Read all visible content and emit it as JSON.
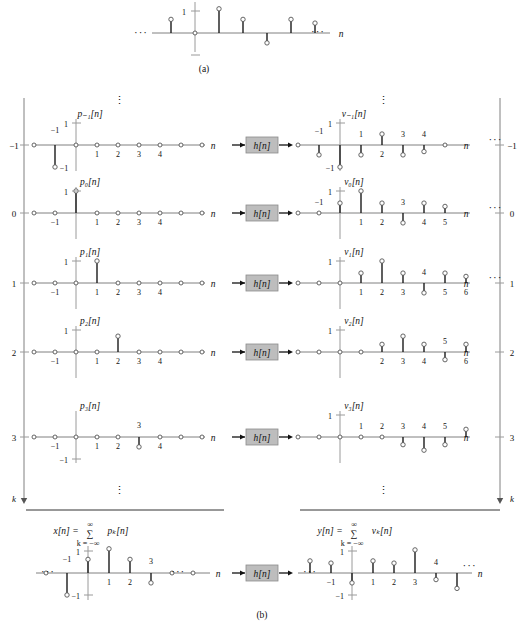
{
  "figure": {
    "caption_a": "(a)",
    "caption_b": "(b)",
    "system_block_label": "h[n]",
    "axis_var": "n",
    "index_var": "k",
    "ellipsis": "···",
    "vertical_ellipsis": "⋮",
    "one": "1",
    "minus_one": "−1"
  },
  "part_a": {
    "name": "x[n] impulse train",
    "axis_label": "n",
    "left_ellipsis": "···",
    "right_ellipsis": "···",
    "ytick_pos": "1",
    "ytick_neg": "−1",
    "samples": [
      {
        "n": -4,
        "value": 0
      },
      {
        "n": -3,
        "value": 0
      },
      {
        "n": -2,
        "value": 0
      },
      {
        "n": -1,
        "value": 0.62
      },
      {
        "n": 0,
        "value": 0
      },
      {
        "n": 1,
        "value": 1.1
      },
      {
        "n": 2,
        "value": 0.62
      },
      {
        "n": 3,
        "value": -0.45
      },
      {
        "n": 4,
        "value": 0.62
      },
      {
        "n": 5,
        "value": 0.45
      },
      {
        "n": 6,
        "value": 0
      }
    ]
  },
  "part_b": {
    "left_column_header": "p_k[n]",
    "right_column_header": "v_k[n]",
    "left_k_label": "k",
    "right_k_label": "k",
    "sum_input": "x[n] = ∑ pₖ[n]",
    "sum_output": "y[n] = ∑ vₖ[n]",
    "sum_limits_top": "∞",
    "sum_limits_bottom": "k = −∞",
    "rows": [
      {
        "k": "−1",
        "input_name": "p₋₁[n]",
        "output_name": "v₋₁[n]",
        "input_ytick": "1",
        "input_neg_label": "−1",
        "input_xticks": [
          "−1",
          "1",
          "2",
          "3",
          "4"
        ],
        "input_samples": [
          {
            "n": -2,
            "value": 0
          },
          {
            "n": -1,
            "value": -1
          },
          {
            "n": 0,
            "value": 0
          },
          {
            "n": 1,
            "value": 0
          },
          {
            "n": 2,
            "value": 0
          },
          {
            "n": 3,
            "value": 0
          },
          {
            "n": 4,
            "value": 0
          },
          {
            "n": 5,
            "value": 0
          },
          {
            "n": 6,
            "value": 0
          }
        ],
        "output_xticks": [
          "−1",
          "1",
          "2",
          "3",
          "4"
        ],
        "output_samples": [
          {
            "n": -2,
            "value": 0
          },
          {
            "n": -1,
            "value": -0.45
          },
          {
            "n": 0,
            "value": -1
          },
          {
            "n": 1,
            "value": -0.45
          },
          {
            "n": 2,
            "value": 0.5
          },
          {
            "n": 3,
            "value": -0.45
          },
          {
            "n": 4,
            "value": -0.3
          },
          {
            "n": 5,
            "value": 0
          }
        ],
        "output_ellipsis": "···"
      },
      {
        "k": "0",
        "input_name": "p₀[n]",
        "output_name": "v₀[n]",
        "input_ytick": "1",
        "input_xticks": [
          "−1",
          "1",
          "2",
          "3",
          "4"
        ],
        "input_samples": [
          {
            "n": -2,
            "value": 0
          },
          {
            "n": -1,
            "value": 0
          },
          {
            "n": 0,
            "value": 1
          },
          {
            "n": 1,
            "value": 0
          },
          {
            "n": 2,
            "value": 0
          },
          {
            "n": 3,
            "value": 0
          },
          {
            "n": 4,
            "value": 0
          },
          {
            "n": 5,
            "value": 0
          },
          {
            "n": 6,
            "value": 0
          }
        ],
        "output_xticks": [
          "−1",
          "1",
          "2",
          "3",
          "4",
          "5"
        ],
        "output_samples": [
          {
            "n": -2,
            "value": 0
          },
          {
            "n": -1,
            "value": 0
          },
          {
            "n": 0,
            "value": 0.45
          },
          {
            "n": 1,
            "value": 1
          },
          {
            "n": 2,
            "value": 0.45
          },
          {
            "n": 3,
            "value": -0.45
          },
          {
            "n": 4,
            "value": 0.45
          },
          {
            "n": 5,
            "value": 0.3
          }
        ],
        "output_ellipsis": "···"
      },
      {
        "k": "1",
        "input_name": "p₁[n]",
        "output_name": "v₁[n]",
        "input_ytick": "1",
        "input_xticks": [
          "−1",
          "1",
          "2",
          "3",
          "4"
        ],
        "input_samples": [
          {
            "n": -2,
            "value": 0
          },
          {
            "n": -1,
            "value": 0
          },
          {
            "n": 0,
            "value": 0
          },
          {
            "n": 1,
            "value": 1
          },
          {
            "n": 2,
            "value": 0
          },
          {
            "n": 3,
            "value": 0
          },
          {
            "n": 4,
            "value": 0
          },
          {
            "n": 5,
            "value": 0
          },
          {
            "n": 6,
            "value": 0
          }
        ],
        "output_xticks": [
          "1",
          "2",
          "3",
          "4",
          "5",
          "6"
        ],
        "output_samples": [
          {
            "n": -2,
            "value": 0
          },
          {
            "n": -1,
            "value": 0
          },
          {
            "n": 0,
            "value": 0
          },
          {
            "n": 1,
            "value": 0.45
          },
          {
            "n": 2,
            "value": 1
          },
          {
            "n": 3,
            "value": 0.45
          },
          {
            "n": 4,
            "value": -0.45
          },
          {
            "n": 5,
            "value": 0.45
          },
          {
            "n": 6,
            "value": 0.3
          }
        ],
        "output_ellipsis": "···"
      },
      {
        "k": "2",
        "input_name": "p₂[n]",
        "output_name": "v₂[n]",
        "input_ytick": "1",
        "input_xticks": [
          "−1",
          "1",
          "2",
          "3",
          "4"
        ],
        "input_samples": [
          {
            "n": -2,
            "value": 0
          },
          {
            "n": -1,
            "value": 0
          },
          {
            "n": 0,
            "value": 0
          },
          {
            "n": 1,
            "value": 0
          },
          {
            "n": 2,
            "value": 0.72
          },
          {
            "n": 3,
            "value": 0
          },
          {
            "n": 4,
            "value": 0
          },
          {
            "n": 5,
            "value": 0
          },
          {
            "n": 6,
            "value": 0
          }
        ],
        "output_xticks": [
          "2",
          "3",
          "4",
          "5",
          "6"
        ],
        "output_samples": [
          {
            "n": -2,
            "value": 0
          },
          {
            "n": -1,
            "value": 0
          },
          {
            "n": 0,
            "value": 0
          },
          {
            "n": 1,
            "value": 0
          },
          {
            "n": 2,
            "value": 0.35
          },
          {
            "n": 3,
            "value": 0.72
          },
          {
            "n": 4,
            "value": 0.35
          },
          {
            "n": 5,
            "value": -0.35
          },
          {
            "n": 6,
            "value": 0.35
          }
        ],
        "output_ellipsis": ""
      },
      {
        "k": "3",
        "input_name": "p₃[n]",
        "output_name": "v₃[n]",
        "input_ytick": "−1",
        "input_xticks": [
          "−1",
          "1",
          "2",
          "4"
        ],
        "input_peak_label": "3",
        "input_samples": [
          {
            "n": -2,
            "value": 0
          },
          {
            "n": -1,
            "value": 0
          },
          {
            "n": 0,
            "value": 0
          },
          {
            "n": 1,
            "value": 0
          },
          {
            "n": 2,
            "value": 0
          },
          {
            "n": 3,
            "value": -0.45
          },
          {
            "n": 4,
            "value": 0
          },
          {
            "n": 5,
            "value": 0
          },
          {
            "n": 6,
            "value": 0
          }
        ],
        "output_xticks": [
          "1",
          "2",
          "3",
          "4",
          "5"
        ],
        "output_samples": [
          {
            "n": -2,
            "value": 0
          },
          {
            "n": -1,
            "value": 0
          },
          {
            "n": 0,
            "value": 0
          },
          {
            "n": 1,
            "value": 0
          },
          {
            "n": 2,
            "value": 0
          },
          {
            "n": 3,
            "value": -0.35
          },
          {
            "n": 4,
            "value": -0.6
          },
          {
            "n": 5,
            "value": -0.35
          },
          {
            "n": 6,
            "value": 0.35
          },
          {
            "n": 7,
            "value": -0.35
          }
        ],
        "output_ellipsis": ""
      }
    ],
    "bottom": {
      "input_name": "x[n]",
      "output_name": "y[n]",
      "input_ytick_pos": "1",
      "input_ytick_neg": "−1",
      "output_ytick_pos": "1",
      "output_ytick_neg": "−1",
      "input_xticks": [
        "−1",
        "1",
        "2"
      ],
      "input_peak_label": "3",
      "output_xticks": [
        "−1",
        "1",
        "2",
        "3",
        "4"
      ],
      "input_left_ellipsis": "···",
      "input_right_ellipsis": "···",
      "output_left_ellipsis": "···",
      "output_right_ellipsis": "···",
      "input_samples": [
        {
          "n": -3,
          "value": 0
        },
        {
          "n": -2,
          "value": 0
        },
        {
          "n": -1,
          "value": -1
        },
        {
          "n": 0,
          "value": 0.62
        },
        {
          "n": 1,
          "value": 1.1
        },
        {
          "n": 2,
          "value": 0.62
        },
        {
          "n": 3,
          "value": -0.45
        },
        {
          "n": 4,
          "value": 0
        },
        {
          "n": 5,
          "value": 0
        }
      ],
      "output_samples": [
        {
          "n": -3,
          "value": 0
        },
        {
          "n": -2,
          "value": 0.55
        },
        {
          "n": -1,
          "value": 0.45
        },
        {
          "n": 0,
          "value": -0.45
        },
        {
          "n": 1,
          "value": 0.55
        },
        {
          "n": 2,
          "value": 0.45
        },
        {
          "n": 3,
          "value": 1.05
        },
        {
          "n": 4,
          "value": -0.3
        },
        {
          "n": 5,
          "value": -0.7
        },
        {
          "n": 6,
          "value": 0
        }
      ]
    }
  },
  "chart_data": {
    "type": "stem",
    "xlabel": "n",
    "ylabel": "",
    "series": [
      {
        "name": "p_-1[n]",
        "x": [
          -1
        ],
        "values": [
          -1
        ]
      },
      {
        "name": "v_-1[n]",
        "x": [
          -1,
          0,
          1,
          2,
          3,
          4
        ],
        "values": [
          -0.45,
          -1,
          -0.45,
          0.5,
          -0.45,
          -0.3
        ]
      },
      {
        "name": "p_0[n]",
        "x": [
          0
        ],
        "values": [
          1
        ]
      },
      {
        "name": "v_0[n]",
        "x": [
          0,
          1,
          2,
          3,
          4,
          5
        ],
        "values": [
          0.45,
          1,
          0.45,
          -0.45,
          0.45,
          0.3
        ]
      },
      {
        "name": "p_1[n]",
        "x": [
          1
        ],
        "values": [
          1
        ]
      },
      {
        "name": "v_1[n]",
        "x": [
          1,
          2,
          3,
          4,
          5,
          6
        ],
        "values": [
          0.45,
          1,
          0.45,
          -0.45,
          0.45,
          0.3
        ]
      },
      {
        "name": "p_2[n]",
        "x": [
          2
        ],
        "values": [
          0.72
        ]
      },
      {
        "name": "v_2[n]",
        "x": [
          2,
          3,
          4,
          5,
          6
        ],
        "values": [
          0.35,
          0.72,
          0.35,
          -0.35,
          0.35
        ]
      },
      {
        "name": "p_3[n]",
        "x": [
          3
        ],
        "values": [
          -0.45
        ]
      },
      {
        "name": "v_3[n]",
        "x": [
          3,
          4,
          5,
          6,
          7
        ],
        "values": [
          -0.35,
          -0.6,
          -0.35,
          0.35,
          -0.35
        ]
      },
      {
        "name": "x[n]",
        "x": [
          -1,
          0,
          1,
          2,
          3
        ],
        "values": [
          -1,
          0.62,
          1.1,
          0.62,
          -0.45
        ]
      },
      {
        "name": "y[n]",
        "x": [
          -2,
          -1,
          0,
          1,
          2,
          3,
          4,
          5
        ],
        "values": [
          0.55,
          0.45,
          -0.45,
          0.55,
          0.45,
          1.05,
          -0.3,
          -0.7
        ]
      }
    ],
    "legend": "none",
    "grid": false
  }
}
